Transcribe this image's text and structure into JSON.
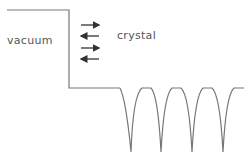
{
  "diagram": {
    "labels": {
      "vacuum": "vacuum",
      "crystal": "crystal"
    },
    "arrows": [
      {
        "direction": "right",
        "y": 25
      },
      {
        "direction": "left",
        "y": 36
      },
      {
        "direction": "right",
        "y": 48
      },
      {
        "direction": "left",
        "y": 59
      }
    ],
    "colors": {
      "line": "#777777",
      "arrow": "#333333",
      "text": "#555555"
    },
    "potential": {
      "vacuum_level_y": 10,
      "surface_x": 69,
      "crystal_level_y": 88,
      "cusp_positions_x": [
        131,
        161,
        192,
        223
      ],
      "cusp_bottom_y": 152
    }
  }
}
